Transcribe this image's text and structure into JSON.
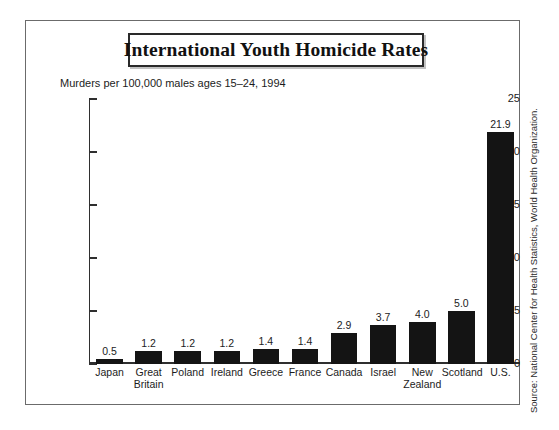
{
  "chart_data": {
    "type": "bar",
    "title": "International Youth Homicide Rates",
    "subtitle": "Murders per 100,000 males ages 15–24, 1994",
    "xlabel": "",
    "ylabel": "",
    "ylim": [
      0,
      25
    ],
    "yticks": [
      0,
      5,
      10,
      15,
      20,
      25
    ],
    "ytick_labels": [
      "0",
      "5",
      "10",
      "15",
      "20",
      "25"
    ],
    "grid": false,
    "legend": null,
    "orientation": "vertical",
    "bar_color": "#141414",
    "categories": [
      "Japan",
      "Great Britain",
      "Poland",
      "Ireland",
      "Greece",
      "France",
      "Canada",
      "Israel",
      "New Zealand",
      "Scotland",
      "U.S."
    ],
    "category_lines": [
      [
        "Japan"
      ],
      [
        "Great",
        "Britain"
      ],
      [
        "Poland"
      ],
      [
        "Ireland"
      ],
      [
        "Greece"
      ],
      [
        "France"
      ],
      [
        "Canada"
      ],
      [
        "Israel"
      ],
      [
        "New",
        "Zealand"
      ],
      [
        "Scotland"
      ],
      [
        "U.S."
      ]
    ],
    "values": [
      0.5,
      1.2,
      1.2,
      1.2,
      1.4,
      1.4,
      2.9,
      3.7,
      4.0,
      5.0,
      21.9
    ],
    "value_labels": [
      "0.5",
      "1.2",
      "1.2",
      "1.2",
      "1.4",
      "1.4",
      "2.9",
      "3.7",
      "4.0",
      "5.0",
      "21.9"
    ]
  },
  "source": {
    "note": "Source: National Center for Health Statistics, World Health Organization."
  }
}
